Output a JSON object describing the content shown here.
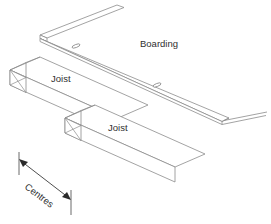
{
  "diagram": {
    "type": "isometric-construction-detail",
    "background_color": "#ffffff",
    "line_color": "#8c8c8c",
    "dimension_color": "#2b2b2b",
    "text_color": "#2f2f2f",
    "labels": {
      "boarding": "Boarding",
      "joist_upper": "Joist",
      "joist_lower": "Joist",
      "centres": "Centres"
    },
    "components": [
      {
        "name": "boarding",
        "label": "Boarding",
        "description": "thin board strip running diagonally over the joists"
      },
      {
        "name": "joist-upper",
        "label": "Joist",
        "description": "rectangular timber beam with hatched cut end"
      },
      {
        "name": "joist-lower",
        "label": "Joist",
        "description": "rectangular timber beam with hatched cut end"
      },
      {
        "name": "centres-dimension",
        "label": "Centres",
        "description": "double headed dimension arrow between joist centres"
      }
    ],
    "fixings": [
      {
        "name": "fixing-upper",
        "shape": "ellipse"
      },
      {
        "name": "fixing-lower",
        "shape": "ellipse"
      }
    ]
  }
}
